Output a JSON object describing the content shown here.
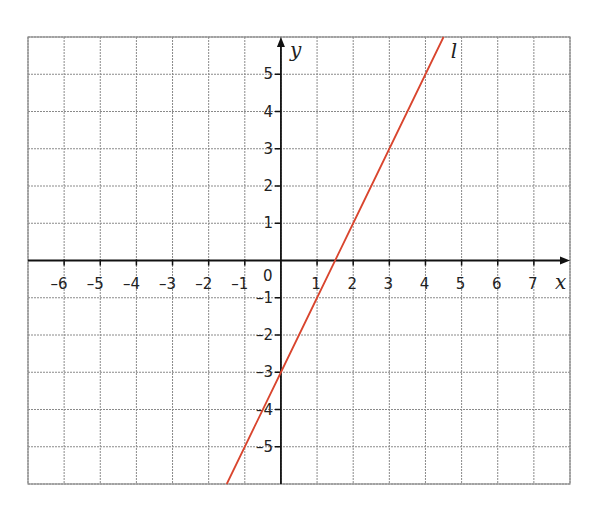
{
  "chart_data": {
    "type": "line",
    "title": "",
    "xlabel": "x",
    "ylabel": "y",
    "xlim": [
      -7,
      8
    ],
    "ylim": [
      -6,
      6
    ],
    "grid": true,
    "x_ticks": [
      -6,
      -5,
      -4,
      -3,
      -2,
      -1,
      1,
      2,
      3,
      4,
      5,
      6,
      7
    ],
    "y_ticks": [
      -5,
      -4,
      -3,
      -2,
      -1,
      1,
      2,
      3,
      4,
      5
    ],
    "origin_label": "0",
    "series": [
      {
        "name": "l",
        "equation": "y = 2x - 3",
        "color": "#d9452e",
        "x": [
          -1.5,
          0,
          1,
          2,
          3,
          4,
          4.5
        ],
        "y": [
          -6,
          -3,
          -1,
          1,
          3,
          5,
          6
        ]
      }
    ],
    "annotations": [
      {
        "text": "l",
        "x": 4.7,
        "y": 5.6
      }
    ]
  }
}
